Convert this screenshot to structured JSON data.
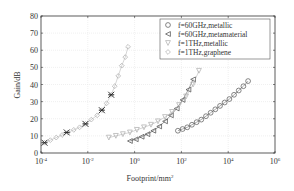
{
  "chart_data": {
    "type": "scatter",
    "title": "",
    "xlabel": "Footprint/mm",
    "xlabel_sup": "2",
    "ylabel": "Gain/dB",
    "xscale": "log",
    "xlim_log10": [
      -4,
      6
    ],
    "ylim": [
      0,
      80
    ],
    "x_ticks": [
      {
        "base": "10",
        "exp": "-4",
        "log": -4
      },
      {
        "base": "10",
        "exp": "-2",
        "log": -2
      },
      {
        "base": "10",
        "exp": "0",
        "log": 0
      },
      {
        "base": "10",
        "exp": "2",
        "log": 2
      },
      {
        "base": "10",
        "exp": "4",
        "log": 4
      },
      {
        "base": "10",
        "exp": "6",
        "log": 6
      }
    ],
    "y_ticks": [
      "0",
      "10",
      "20",
      "30",
      "40",
      "50",
      "60",
      "70",
      "80"
    ],
    "y_tick_values": [
      0,
      10,
      20,
      30,
      40,
      50,
      60,
      70,
      80
    ],
    "grid": true,
    "legend_position": "top-right",
    "series": [
      {
        "name": "f=60GHz,metallic",
        "marker": "circle",
        "color": "#555555",
        "log_x": [
          1.85,
          2.05,
          2.25,
          2.45,
          2.65,
          2.85,
          3.05,
          3.25,
          3.45,
          3.65,
          3.85,
          4.05,
          4.25,
          4.45,
          4.65,
          4.85
        ],
        "y": [
          13,
          14,
          15,
          16.5,
          18,
          19.5,
          21.5,
          23.5,
          25.5,
          27.5,
          29.5,
          31.5,
          34,
          36.5,
          39,
          42
        ]
      },
      {
        "name": "f=60GHz,metamaterial",
        "marker": "triangle-left",
        "color": "#444444",
        "log_x": [
          -0.2,
          0.05,
          0.3,
          0.55,
          0.8,
          1.05,
          1.3,
          1.55,
          1.8,
          2.05,
          2.3,
          2.5
        ],
        "y": [
          7,
          8,
          9.5,
          11,
          13,
          15.5,
          18.5,
          22,
          26,
          31,
          37,
          43
        ]
      },
      {
        "name": "f=1THz,metallic",
        "marker": "triangle-down",
        "color": "#aaaaaa",
        "log_x": [
          -1.1,
          -0.8,
          -0.5,
          -0.2,
          0.1,
          0.4,
          0.7,
          1.0,
          1.3,
          1.6,
          1.9,
          2.2,
          2.5,
          2.75
        ],
        "y": [
          9,
          10,
          11,
          12,
          13.5,
          15,
          16.5,
          18.5,
          21,
          24,
          28,
          33,
          40,
          48
        ]
      },
      {
        "name": "f=1THz,graphene",
        "marker": "diamond",
        "color": "#aaaaaa",
        "log_x": [
          -3.85,
          -3.6,
          -3.35,
          -3.1,
          -2.85,
          -2.6,
          -2.35,
          -2.1,
          -1.85,
          -1.6,
          -1.4,
          -1.2,
          -1.0,
          -0.85,
          -0.7,
          -0.55,
          -0.4,
          -0.28
        ],
        "y": [
          6,
          7.5,
          9,
          10.5,
          12,
          13.5,
          15,
          17,
          19.5,
          22,
          25,
          29,
          34,
          39,
          45,
          51,
          56,
          62
        ]
      }
    ],
    "annotations": {
      "name": "measured points",
      "marker": "cross",
      "color": "#222222",
      "log_x": [
        -3.85,
        -2.9,
        -2.1,
        -1.4,
        -1.0
      ],
      "y": [
        6,
        12,
        17,
        25,
        34
      ]
    }
  }
}
